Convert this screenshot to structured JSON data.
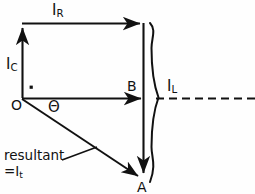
{
  "figure": {
    "type": "phasor-diagram",
    "background_color": "#fefefe",
    "stroke_color": "#111111",
    "title": "",
    "labels": {
      "i_r": "I",
      "i_r_sub": "R",
      "i_c": "I",
      "i_c_sub": "C",
      "i_l": "I",
      "i_l_sub": "L",
      "point_b": "B",
      "point_o": "O",
      "point_a": "A",
      "angle_theta": "Θ",
      "resultant_line1": "resultant",
      "resultant_line2": "=I",
      "resultant_sub": "t"
    },
    "geometry": {
      "origin": {
        "x": 22,
        "y": 98
      },
      "point_b": {
        "x": 145,
        "y": 98
      },
      "point_a": {
        "x": 142,
        "y": 178
      },
      "top_left": {
        "x": 22,
        "y": 23
      },
      "top_right": {
        "x": 145,
        "y": 23
      },
      "brace_top": {
        "x": 152,
        "y": 22
      },
      "brace_bottom": {
        "x": 152,
        "y": 182
      },
      "brace_mid": {
        "x": 161,
        "y": 98
      },
      "dashed_line": {
        "x1": 156,
        "y1": 98,
        "x2": 255,
        "y2": 98
      },
      "right_angle_dot": {
        "x": 31,
        "y": 87
      },
      "leader_line": {
        "x1": 62,
        "y1": 160,
        "x2": 97,
        "y2": 147
      }
    },
    "vectors": [
      {
        "name": "I_R",
        "from": "O-top",
        "to": "top-right",
        "direction": "right",
        "label": "IR"
      },
      {
        "name": "I_C",
        "from": "O",
        "to": "top-left",
        "direction": "up",
        "label": "IC"
      },
      {
        "name": "I_B",
        "from": "O",
        "to": "B",
        "direction": "right",
        "label": "B"
      },
      {
        "name": "I_L",
        "from": "top-right",
        "to": "A",
        "direction": "down",
        "label": "IL"
      },
      {
        "name": "resultant",
        "from": "O",
        "to": "A",
        "direction": "down-right",
        "label": "It"
      }
    ]
  }
}
